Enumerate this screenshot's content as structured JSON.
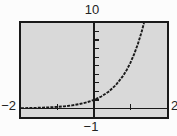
{
  "figure": {
    "kind": "graphing-calculator-screen",
    "background_color": "#fcfcfc",
    "plot_background_color": "#d9d9d9",
    "border_color": "#1a1a1a",
    "ink_color": "#1a1a1a",
    "label_color": "#232323"
  },
  "labels": {
    "y_max": "10",
    "x_min": "−2",
    "x_max": "2",
    "y_min": "−1"
  },
  "chart_data": {
    "type": "line",
    "title": "",
    "xlabel": "",
    "ylabel": "",
    "xlim": [
      -2,
      2
    ],
    "ylim": [
      -1,
      10
    ],
    "x_ticks": [
      -1,
      1
    ],
    "y_ticks": [
      1,
      2,
      3,
      4,
      5,
      6,
      7,
      8,
      9
    ],
    "grid": false,
    "legend": null,
    "axis_edge_labels": {
      "top": "10",
      "left": "−2",
      "right": "2",
      "bottom": "−1"
    },
    "series": [
      {
        "name": "exponential-curve",
        "description": "increasing exponential, y=1 at x=0, reaches y=10 near x=1.37",
        "x": [
          -2.0,
          -1.8,
          -1.6,
          -1.4,
          -1.2,
          -1.0,
          -0.8,
          -0.6,
          -0.4,
          -0.2,
          0.0,
          0.2,
          0.4,
          0.6,
          0.8,
          0.9,
          1.0,
          1.1,
          1.2,
          1.3,
          1.37
        ],
        "y": [
          0.035,
          0.049,
          0.068,
          0.095,
          0.133,
          0.186,
          0.261,
          0.365,
          0.511,
          0.715,
          1.0,
          1.4,
          1.959,
          2.742,
          3.837,
          4.539,
          5.37,
          6.353,
          7.515,
          8.89,
          10.0
        ]
      }
    ]
  }
}
